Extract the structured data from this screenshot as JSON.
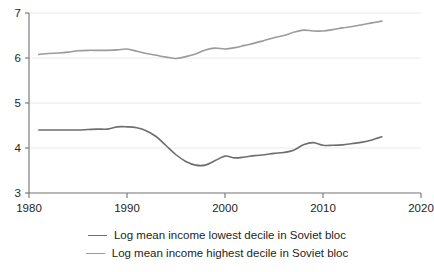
{
  "chart_data": {
    "type": "line",
    "title": "",
    "xlabel": "",
    "ylabel": "",
    "xlim": [
      1980,
      2020
    ],
    "ylim": [
      3,
      7
    ],
    "xticks": [
      "1980",
      "1990",
      "2000",
      "2010",
      "2020"
    ],
    "yticks": [
      "3",
      "4",
      "5",
      "6",
      "7"
    ],
    "grid": true,
    "legend_position": "bottom",
    "series": [
      {
        "name": "Log mean income lowest decile in Soviet bloc",
        "color": "#6e6e6e",
        "x": [
          1981,
          1982,
          1983,
          1984,
          1985,
          1986,
          1987,
          1988,
          1989,
          1990,
          1991,
          1992,
          1993,
          1994,
          1995,
          1996,
          1997,
          1998,
          1999,
          2000,
          2001,
          2002,
          2003,
          2004,
          2005,
          2006,
          2007,
          2008,
          2009,
          2010,
          2011,
          2012,
          2013,
          2014,
          2015,
          2016
        ],
        "values": [
          4.4,
          4.4,
          4.4,
          4.4,
          4.4,
          4.41,
          4.42,
          4.42,
          4.47,
          4.47,
          4.45,
          4.38,
          4.25,
          4.05,
          3.85,
          3.7,
          3.62,
          3.62,
          3.72,
          3.82,
          3.78,
          3.8,
          3.83,
          3.85,
          3.88,
          3.9,
          3.95,
          4.07,
          4.12,
          4.06,
          4.06,
          4.07,
          4.1,
          4.13,
          4.18,
          4.25
        ]
      },
      {
        "name": "Log mean income highest decile in Soviet bloc",
        "color": "#9b9b9b",
        "x": [
          1981,
          1982,
          1983,
          1984,
          1985,
          1986,
          1987,
          1988,
          1989,
          1990,
          1991,
          1992,
          1993,
          1994,
          1995,
          1996,
          1997,
          1998,
          1999,
          2000,
          2001,
          2002,
          2003,
          2004,
          2005,
          2006,
          2007,
          2008,
          2009,
          2010,
          2011,
          2012,
          2013,
          2014,
          2015,
          2016
        ],
        "values": [
          6.08,
          6.1,
          6.11,
          6.13,
          6.16,
          6.17,
          6.17,
          6.17,
          6.18,
          6.2,
          6.15,
          6.1,
          6.06,
          6.02,
          5.99,
          6.03,
          6.09,
          6.18,
          6.22,
          6.2,
          6.23,
          6.28,
          6.33,
          6.39,
          6.45,
          6.5,
          6.57,
          6.62,
          6.6,
          6.6,
          6.63,
          6.67,
          6.7,
          6.74,
          6.78,
          6.82
        ]
      }
    ]
  },
  "legend": {
    "items": [
      {
        "label": "Log mean income lowest decile in Soviet bloc",
        "color": "#6e6e6e"
      },
      {
        "label": "Log mean income highest decile in Soviet bloc",
        "color": "#9b9b9b"
      }
    ]
  }
}
